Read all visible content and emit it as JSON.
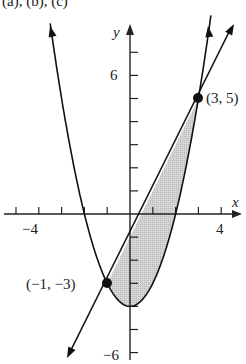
{
  "header": {
    "text": "(a), (b), (c)"
  },
  "chart_data": {
    "type": "line",
    "title": "",
    "xlabel": "x",
    "ylabel": "y",
    "xlim": [
      -5.5,
      5
    ],
    "ylim": [
      -6.5,
      8
    ],
    "x_tick_labels": [
      "-4",
      "4"
    ],
    "y_tick_labels": [
      "6",
      "-6"
    ],
    "series": [
      {
        "name": "parabola",
        "equation": "y = x^2 - 4"
      },
      {
        "name": "line",
        "equation": "y = 2x - 1"
      }
    ],
    "shaded_region": {
      "between": [
        "line",
        "parabola"
      ],
      "x_from": -1,
      "x_to": 3,
      "color": "#cfcfcf"
    },
    "points": [
      {
        "x": 3,
        "y": 5,
        "label": "(3, 5)"
      },
      {
        "x": -1,
        "y": -3,
        "label": "(−1, −3)"
      }
    ],
    "grid": false
  },
  "labels": {
    "x_axis": "x",
    "y_axis": "y",
    "tick_neg4": "−4",
    "tick_4": "4",
    "tick_6": "6",
    "tick_neg6": "−6",
    "point_a": "(3, 5)",
    "point_b": "(−1, −3)"
  }
}
